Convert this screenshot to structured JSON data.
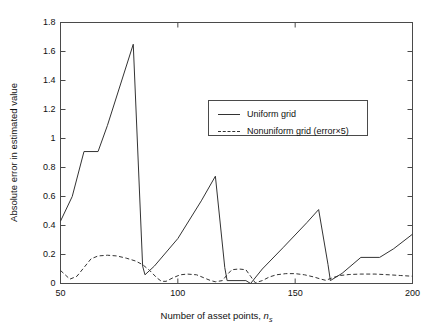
{
  "figure": {
    "background": "#ffffff",
    "axis_color": "#4a4a4a",
    "line_color": "#333333"
  },
  "chart_data": {
    "type": "line",
    "title": "",
    "xlabel": "Number of asset points, n_s",
    "xlabel_main": "Number of asset points, ",
    "xlabel_var": "n",
    "xlabel_sub": "s",
    "ylabel": "Absolute error in estimated value",
    "xlim": [
      50,
      200
    ],
    "ylim": [
      0,
      1.8
    ],
    "xticks": [
      50,
      100,
      150,
      200
    ],
    "xtick_labels": [
      "50",
      "100",
      "150",
      "200"
    ],
    "yticks": [
      0,
      0.2,
      0.4,
      0.6,
      0.8,
      1,
      1.2,
      1.4,
      1.6,
      1.8
    ],
    "ytick_labels": [
      "0",
      "0.2",
      "0.4",
      "0.6",
      "0.8",
      "1",
      "1.2",
      "1.4",
      "1.6",
      "1.8"
    ],
    "grid": false,
    "legend_position": "upper-center",
    "series": [
      {
        "name": "Uniform grid",
        "style": "solid",
        "color": "#333333",
        "points": [
          [
            50,
            0.43
          ],
          [
            55,
            0.6
          ],
          [
            60,
            0.91
          ],
          [
            66,
            0.91
          ],
          [
            70,
            1.09
          ],
          [
            81,
            1.65
          ],
          [
            85,
            0.12
          ],
          [
            86,
            0.06
          ],
          [
            90,
            0.12
          ],
          [
            100,
            0.31
          ],
          [
            110,
            0.57
          ],
          [
            116,
            0.74
          ],
          [
            120,
            0.11
          ],
          [
            121,
            0.02
          ],
          [
            129,
            0.02
          ],
          [
            131,
            0.0
          ],
          [
            136,
            0.1
          ],
          [
            145,
            0.25
          ],
          [
            155,
            0.42
          ],
          [
            160,
            0.51
          ],
          [
            164,
            0.13
          ],
          [
            165,
            0.02
          ],
          [
            170,
            0.07
          ],
          [
            178,
            0.18
          ],
          [
            186,
            0.18
          ],
          [
            192,
            0.24
          ],
          [
            200,
            0.34
          ]
        ]
      },
      {
        "name": "Nonuniform grid (error×5)",
        "style": "dashed",
        "color": "#333333",
        "points": [
          [
            50,
            0.09
          ],
          [
            52,
            0.06
          ],
          [
            54,
            0.03
          ],
          [
            57,
            0.05
          ],
          [
            60,
            0.11
          ],
          [
            63,
            0.17
          ],
          [
            66,
            0.19
          ],
          [
            70,
            0.195
          ],
          [
            74,
            0.19
          ],
          [
            78,
            0.175
          ],
          [
            82,
            0.155
          ],
          [
            85,
            0.13
          ],
          [
            88,
            0.09
          ],
          [
            91,
            0.04
          ],
          [
            93,
            0.015
          ],
          [
            95,
            0.015
          ],
          [
            98,
            0.04
          ],
          [
            101,
            0.06
          ],
          [
            104,
            0.065
          ],
          [
            108,
            0.06
          ],
          [
            111,
            0.04
          ],
          [
            114,
            0.02
          ],
          [
            116,
            0.012
          ],
          [
            119,
            0.02
          ],
          [
            121,
            0.06
          ],
          [
            123,
            0.095
          ],
          [
            126,
            0.1
          ],
          [
            129,
            0.095
          ],
          [
            131,
            0.05
          ],
          [
            133,
            0.005
          ],
          [
            136,
            0.02
          ],
          [
            139,
            0.045
          ],
          [
            142,
            0.06
          ],
          [
            146,
            0.068
          ],
          [
            150,
            0.068
          ],
          [
            154,
            0.06
          ],
          [
            158,
            0.045
          ],
          [
            161,
            0.03
          ],
          [
            163,
            0.022
          ],
          [
            166,
            0.04
          ],
          [
            169,
            0.055
          ],
          [
            173,
            0.062
          ],
          [
            178,
            0.065
          ],
          [
            184,
            0.065
          ],
          [
            190,
            0.06
          ],
          [
            195,
            0.055
          ],
          [
            200,
            0.05
          ]
        ]
      }
    ]
  },
  "legend": {
    "entries": [
      {
        "label": "Uniform grid",
        "style": "solid"
      },
      {
        "label": "Nonuniform grid (error×5)",
        "style": "dashed"
      }
    ]
  }
}
